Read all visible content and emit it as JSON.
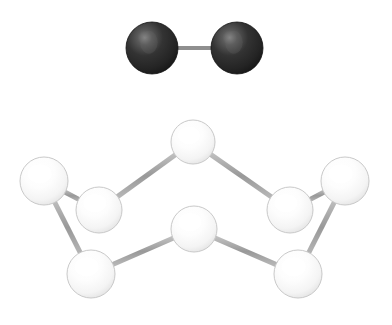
{
  "canvas": {
    "width": 392,
    "height": 325,
    "background": "#ffffff",
    "title": "ball-and-stick molecular models"
  },
  "palette": {
    "dark_atom_core": "#1c1c1c",
    "dark_atom_mid": "#2e2e2e",
    "dark_atom_highlight": "#6f6f6f",
    "dark_atom_edge": "#121212",
    "light_atom_core": "#ffffff",
    "light_atom_mid": "#fbfbfb",
    "light_atom_edge": "#d4d4d4",
    "light_atom_outline": "#c9c9c9",
    "bond_color": "#9a9a9a",
    "bond_dark_color": "#8f8f8f",
    "bond_light_edge": "#bdbdbd"
  },
  "molecules": [
    {
      "id": "diatomic-top",
      "name": "diatomic-molecule",
      "atom_style": "dark",
      "atoms": [
        {
          "id": "d1",
          "name": "dark-atom-left",
          "cx": 152,
          "cy": 48,
          "r": 26
        },
        {
          "id": "d2",
          "name": "dark-atom-right",
          "cx": 237,
          "cy": 48,
          "r": 26
        }
      ],
      "bonds": [
        {
          "id": "db1",
          "name": "bond-d1-d2",
          "from": "d1",
          "to": "d2",
          "width": 4
        }
      ]
    },
    {
      "id": "eight-ring-bottom",
      "name": "puckered-eight-atom-ring",
      "atom_style": "light",
      "atoms": [
        {
          "id": "w1",
          "name": "light-atom-far-left",
          "cx": 44,
          "cy": 181,
          "r": 24
        },
        {
          "id": "w2",
          "name": "light-atom-upper-left",
          "cx": 99,
          "cy": 210,
          "r": 23
        },
        {
          "id": "w3",
          "name": "light-atom-top-center",
          "cx": 193,
          "cy": 142,
          "r": 22
        },
        {
          "id": "w4",
          "name": "light-atom-upper-right",
          "cx": 290,
          "cy": 210,
          "r": 23
        },
        {
          "id": "w5",
          "name": "light-atom-far-right",
          "cx": 345,
          "cy": 181,
          "r": 24
        },
        {
          "id": "w6",
          "name": "light-atom-bottom-right",
          "cx": 298,
          "cy": 274,
          "r": 24
        },
        {
          "id": "w7",
          "name": "light-atom-bottom-center",
          "cx": 194,
          "cy": 229,
          "r": 23
        },
        {
          "id": "w8",
          "name": "light-atom-bottom-left",
          "cx": 91,
          "cy": 274,
          "r": 24
        }
      ],
      "bonds": [
        {
          "id": "wb1",
          "name": "bond-far-left-upper-left",
          "from": "w1",
          "to": "w2",
          "width": 5
        },
        {
          "id": "wb2",
          "name": "bond-upper-left-top-center",
          "from": "w2",
          "to": "w3",
          "width": 5
        },
        {
          "id": "wb3",
          "name": "bond-top-center-upper-right",
          "from": "w3",
          "to": "w4",
          "width": 5
        },
        {
          "id": "wb4",
          "name": "bond-upper-right-far-right",
          "from": "w4",
          "to": "w5",
          "width": 5
        },
        {
          "id": "wb5",
          "name": "bond-far-right-bottom-right",
          "from": "w5",
          "to": "w6",
          "width": 5
        },
        {
          "id": "wb6",
          "name": "bond-bottom-right-bottom-center",
          "from": "w6",
          "to": "w7",
          "width": 5
        },
        {
          "id": "wb7",
          "name": "bond-bottom-center-bottom-left",
          "from": "w7",
          "to": "w8",
          "width": 5
        },
        {
          "id": "wb8",
          "name": "bond-bottom-left-far-left",
          "from": "w8",
          "to": "w1",
          "width": 5
        }
      ]
    }
  ]
}
